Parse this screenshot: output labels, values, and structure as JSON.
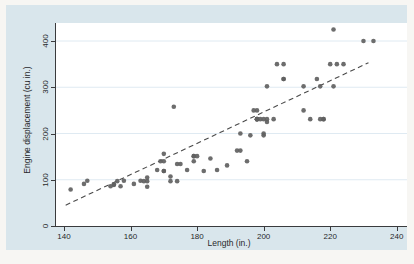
{
  "chart": {
    "background_color": "#d9e6ec",
    "page_color": "#f7f6f3",
    "plot_background_color": "#ffffff",
    "gridline_color": "#dfeaf2",
    "axis_color": "#3a3b3d",
    "text_color": "#28292b",
    "marker_color": "#616161",
    "fit_line_color": "#4a4a4a"
  },
  "chart_data": {
    "type": "scatter",
    "title": "",
    "xlabel": "Length (in.)",
    "ylabel": "Engine displacement (cu in.)",
    "xlim": [
      137.6,
      243.1
    ],
    "ylim": [
      0,
      439
    ],
    "xticks": [
      140,
      160,
      180,
      200,
      220,
      240
    ],
    "yticks": [
      0,
      100,
      200,
      300,
      400
    ],
    "grid": "horizontal",
    "legend": "none",
    "points": [
      [
        142,
        79
      ],
      [
        146,
        91
      ],
      [
        147,
        98
      ],
      [
        154,
        86
      ],
      [
        155,
        89
      ],
      [
        155,
        90
      ],
      [
        156,
        97
      ],
      [
        157,
        86
      ],
      [
        158,
        98
      ],
      [
        161,
        91
      ],
      [
        163,
        98
      ],
      [
        164,
        97
      ],
      [
        165,
        85
      ],
      [
        165,
        97
      ],
      [
        165,
        105
      ],
      [
        168,
        121
      ],
      [
        169,
        140
      ],
      [
        170,
        119
      ],
      [
        170,
        119
      ],
      [
        170,
        140
      ],
      [
        170,
        156
      ],
      [
        172,
        97
      ],
      [
        172,
        107
      ],
      [
        173,
        258
      ],
      [
        174,
        97
      ],
      [
        174,
        134
      ],
      [
        175,
        134
      ],
      [
        177,
        121
      ],
      [
        179,
        140
      ],
      [
        179,
        151
      ],
      [
        179,
        151
      ],
      [
        180,
        151
      ],
      [
        182,
        119
      ],
      [
        184,
        146
      ],
      [
        186,
        121
      ],
      [
        189,
        131
      ],
      [
        192,
        163
      ],
      [
        193,
        163
      ],
      [
        193,
        200
      ],
      [
        195,
        140
      ],
      [
        196,
        196
      ],
      [
        197,
        250
      ],
      [
        198,
        231
      ],
      [
        198,
        231
      ],
      [
        198,
        231
      ],
      [
        198,
        231
      ],
      [
        198,
        250
      ],
      [
        199,
        231
      ],
      [
        200,
        196
      ],
      [
        200,
        200
      ],
      [
        200,
        231
      ],
      [
        201,
        225
      ],
      [
        201,
        231
      ],
      [
        201,
        302
      ],
      [
        203,
        231
      ],
      [
        204,
        350
      ],
      [
        206,
        318
      ],
      [
        206,
        318
      ],
      [
        206,
        350
      ],
      [
        212,
        250
      ],
      [
        212,
        302
      ],
      [
        214,
        231
      ],
      [
        216,
        318
      ],
      [
        217,
        231
      ],
      [
        217,
        302
      ],
      [
        218,
        231
      ],
      [
        218,
        231
      ],
      [
        220,
        350
      ],
      [
        221,
        302
      ],
      [
        221,
        425
      ],
      [
        222,
        350
      ],
      [
        224,
        350
      ],
      [
        230,
        400
      ],
      [
        233,
        400
      ]
    ],
    "fit_line": {
      "style": "dashed",
      "points": [
        [
          140.5,
          45
        ],
        [
          231.5,
          353
        ]
      ]
    }
  }
}
